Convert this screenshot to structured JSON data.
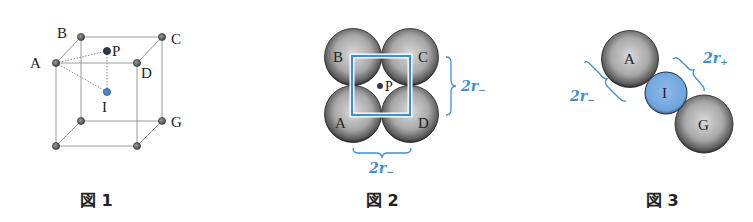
{
  "figures": [
    {
      "caption": "図 1",
      "labels": {
        "A": "A",
        "B": "B",
        "C": "C",
        "D": "D",
        "G": "G",
        "P": "P",
        "I": "I"
      }
    },
    {
      "caption": "図 2",
      "labels": {
        "A": "A",
        "B": "B",
        "C": "C",
        "D": "D",
        "P": "P"
      },
      "dimension_right": {
        "main": "2r",
        "sub": "−"
      },
      "dimension_bottom": {
        "main": "2r",
        "sub": "−"
      }
    },
    {
      "caption": "図 3",
      "labels": {
        "A": "A",
        "I": "I",
        "G": "G"
      },
      "dimension_left": {
        "main": "2r",
        "sub": "−"
      },
      "dimension_right": {
        "main": "2r",
        "sub": "+"
      }
    }
  ],
  "colors": {
    "annotation_blue": "#3d8fd1",
    "cation_fill": "#7fb0e6",
    "anion_fill": "#9c9c9c",
    "vertex_fill": "#777777",
    "center_dot": "#4a86c5",
    "p_dot": "#2b3a55"
  }
}
